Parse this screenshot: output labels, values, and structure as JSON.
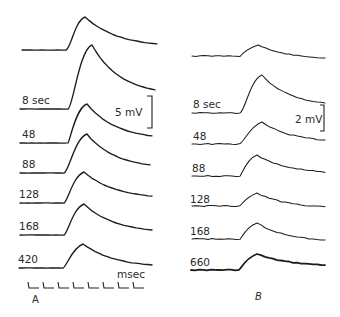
{
  "figure": {
    "panels": [
      {
        "id": "A",
        "label": "A",
        "scale_bar": {
          "label": "5 mV"
        },
        "time_marker": {
          "label": "msec",
          "tick_count": 8
        },
        "traces": [
          {
            "label": "",
            "baseline_y": 50,
            "peak": [
              85,
              17
            ],
            "end": [
              157,
              44
            ],
            "onset_x": 69,
            "start_x": 22
          },
          {
            "label": "8 sec",
            "baseline_y": 109,
            "peak": [
              92,
              45
            ],
            "end": [
              155,
              90
            ],
            "onset_x": 71,
            "start_x": 20
          },
          {
            "label": "48",
            "baseline_y": 143,
            "peak": [
              87,
              104
            ],
            "end": [
              152,
              136
            ],
            "onset_x": 68,
            "start_x": 20
          },
          {
            "label": "88",
            "baseline_y": 173,
            "peak": [
              87,
              134
            ],
            "end": [
              150,
              165
            ],
            "onset_x": 67,
            "start_x": 20
          },
          {
            "label": "128",
            "baseline_y": 203,
            "peak": [
              84,
              172
            ],
            "end": [
              152,
              196
            ],
            "onset_x": 66,
            "start_x": 20
          },
          {
            "label": "168",
            "baseline_y": 235,
            "peak": [
              84,
              204
            ],
            "end": [
              152,
              230
            ],
            "onset_x": 66,
            "start_x": 20
          },
          {
            "label": "420",
            "baseline_y": 268,
            "peak": [
              83,
              244
            ],
            "end": [
              152,
              265
            ],
            "onset_x": 65,
            "start_x": 19
          }
        ]
      },
      {
        "id": "B",
        "label": "B",
        "scale_bar": {
          "label": "2 mV"
        },
        "traces": [
          {
            "label": "",
            "baseline_y": 56,
            "peak": [
              258,
              45
            ],
            "end": [
              325,
              58
            ],
            "onset_x": 240,
            "start_x": 192
          },
          {
            "label": "8 sec",
            "baseline_y": 113,
            "peak": [
              262,
              75
            ],
            "end": [
              325,
              103
            ],
            "onset_x": 243,
            "start_x": 192
          },
          {
            "label": "48",
            "baseline_y": 144,
            "peak": [
              262,
              122
            ],
            "end": [
              325,
              140
            ],
            "onset_x": 242,
            "start_x": 192
          },
          {
            "label": "88",
            "baseline_y": 176,
            "peak": [
              257,
              155
            ],
            "end": [
              325,
              172
            ],
            "onset_x": 240,
            "start_x": 192
          },
          {
            "label": "128",
            "baseline_y": 206,
            "peak": [
              257,
              193
            ],
            "end": [
              325,
              207
            ],
            "onset_x": 240,
            "start_x": 192
          },
          {
            "label": "168",
            "baseline_y": 239,
            "peak": [
              257,
              223
            ],
            "end": [
              325,
              240
            ],
            "onset_x": 240,
            "start_x": 192
          },
          {
            "label": "660",
            "baseline_y": 270,
            "peak": [
              257,
              254
            ],
            "end": [
              325,
              265
            ],
            "onset_x": 239,
            "start_x": 191
          }
        ]
      }
    ]
  }
}
